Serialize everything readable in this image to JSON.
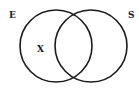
{
  "diagram": {
    "type": "venn",
    "sets": [
      {
        "label": "E",
        "cx": 56,
        "cy": 46,
        "r": 36
      },
      {
        "label": "S",
        "cx": 91,
        "cy": 46,
        "r": 36
      }
    ],
    "marker": {
      "label": "X",
      "region": "E only"
    },
    "colors": {
      "stroke": "#1a1a1a",
      "background": "#ffffff"
    }
  }
}
